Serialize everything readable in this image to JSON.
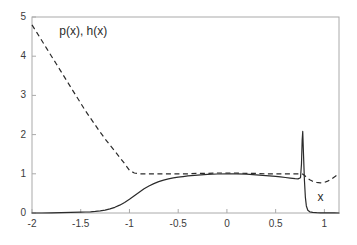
{
  "chart_data": {
    "type": "line",
    "title": "",
    "xlabel": "x",
    "ylabel": "p(x), h(x)",
    "xlim": [
      -2,
      1.15
    ],
    "ylim": [
      0,
      5
    ],
    "grid": false,
    "legend": "none",
    "xticks": [
      "-2",
      "-1.5",
      "-1",
      "-0.5",
      "0",
      "0.5",
      "1"
    ],
    "xtick_values": [
      -2,
      -1.5,
      -1,
      -0.5,
      0,
      0.5,
      1
    ],
    "yticks": [
      "0",
      "1",
      "2",
      "3",
      "4",
      "5"
    ],
    "ytick_values": [
      0,
      1,
      2,
      3,
      4,
      5
    ],
    "series": [
      {
        "name": "h(x)",
        "style": "dashed",
        "color": "#2b2b2b",
        "x": [
          -2.0,
          -1.95,
          -1.9,
          -1.85,
          -1.8,
          -1.75,
          -1.7,
          -1.65,
          -1.6,
          -1.55,
          -1.5,
          -1.45,
          -1.4,
          -1.35,
          -1.3,
          -1.25,
          -1.2,
          -1.15,
          -1.1,
          -1.05,
          -1.0,
          -0.95,
          -0.9,
          -0.85,
          -0.8,
          -0.7,
          -0.6,
          -0.5,
          -0.4,
          -0.3,
          -0.2,
          -0.1,
          0.0,
          0.1,
          0.2,
          0.3,
          0.4,
          0.5,
          0.55,
          0.6,
          0.65,
          0.7,
          0.72,
          0.74,
          0.76,
          0.78,
          0.8,
          0.82,
          0.85,
          0.88,
          0.92,
          0.96,
          1.0,
          1.04,
          1.08,
          1.12,
          1.15
        ],
        "y": [
          4.8,
          4.6,
          4.4,
          4.2,
          4.0,
          3.8,
          3.6,
          3.4,
          3.2,
          3.0,
          2.8,
          2.6,
          2.42,
          2.24,
          2.06,
          1.89,
          1.73,
          1.58,
          1.42,
          1.26,
          1.09,
          1.02,
          1.0,
          1.0,
          1.0,
          1.0,
          1.0,
          1.0,
          1.0,
          1.01,
          1.01,
          1.02,
          1.02,
          1.02,
          1.01,
          1.01,
          1.0,
          1.0,
          1.0,
          1.0,
          1.0,
          1.0,
          1.0,
          1.0,
          1.0,
          0.99,
          0.95,
          0.9,
          0.85,
          0.81,
          0.78,
          0.77,
          0.78,
          0.82,
          0.88,
          0.95,
          1.0
        ]
      },
      {
        "name": "p(x)",
        "style": "solid",
        "color": "#2b2b2b",
        "x": [
          -2.0,
          -1.9,
          -1.8,
          -1.7,
          -1.6,
          -1.5,
          -1.45,
          -1.4,
          -1.35,
          -1.3,
          -1.25,
          -1.2,
          -1.15,
          -1.1,
          -1.05,
          -1.0,
          -0.95,
          -0.9,
          -0.85,
          -0.8,
          -0.75,
          -0.7,
          -0.65,
          -0.6,
          -0.55,
          -0.5,
          -0.45,
          -0.4,
          -0.3,
          -0.2,
          -0.1,
          0.0,
          0.1,
          0.2,
          0.3,
          0.4,
          0.5,
          0.55,
          0.6,
          0.65,
          0.7,
          0.73,
          0.755,
          0.765,
          0.772,
          0.778,
          0.785,
          0.795,
          0.805,
          0.815,
          0.83,
          0.85,
          0.88,
          0.92,
          0.96,
          1.0,
          1.05,
          1.1,
          1.15
        ],
        "y": [
          0.0,
          0.0,
          0.005,
          0.01,
          0.015,
          0.02,
          0.025,
          0.03,
          0.04,
          0.055,
          0.075,
          0.105,
          0.145,
          0.2,
          0.27,
          0.35,
          0.44,
          0.53,
          0.62,
          0.69,
          0.75,
          0.8,
          0.84,
          0.87,
          0.895,
          0.915,
          0.93,
          0.945,
          0.965,
          0.985,
          0.995,
          1.0,
          0.998,
          0.99,
          0.975,
          0.955,
          0.935,
          0.92,
          0.905,
          0.89,
          0.875,
          0.87,
          0.9,
          1.25,
          1.85,
          2.08,
          1.55,
          0.85,
          0.4,
          0.18,
          0.07,
          0.03,
          0.015,
          0.008,
          0.005,
          0.003,
          0.002,
          0.001,
          0.0
        ]
      }
    ],
    "annotations": [
      {
        "text": "p(x), h(x)",
        "x": -1.72,
        "y": 4.62
      },
      {
        "text": "x",
        "x": 0.93,
        "y": 0.38
      }
    ]
  },
  "axis": {
    "y_label_text": "p(x), h(x)",
    "x_label_text": "x"
  }
}
